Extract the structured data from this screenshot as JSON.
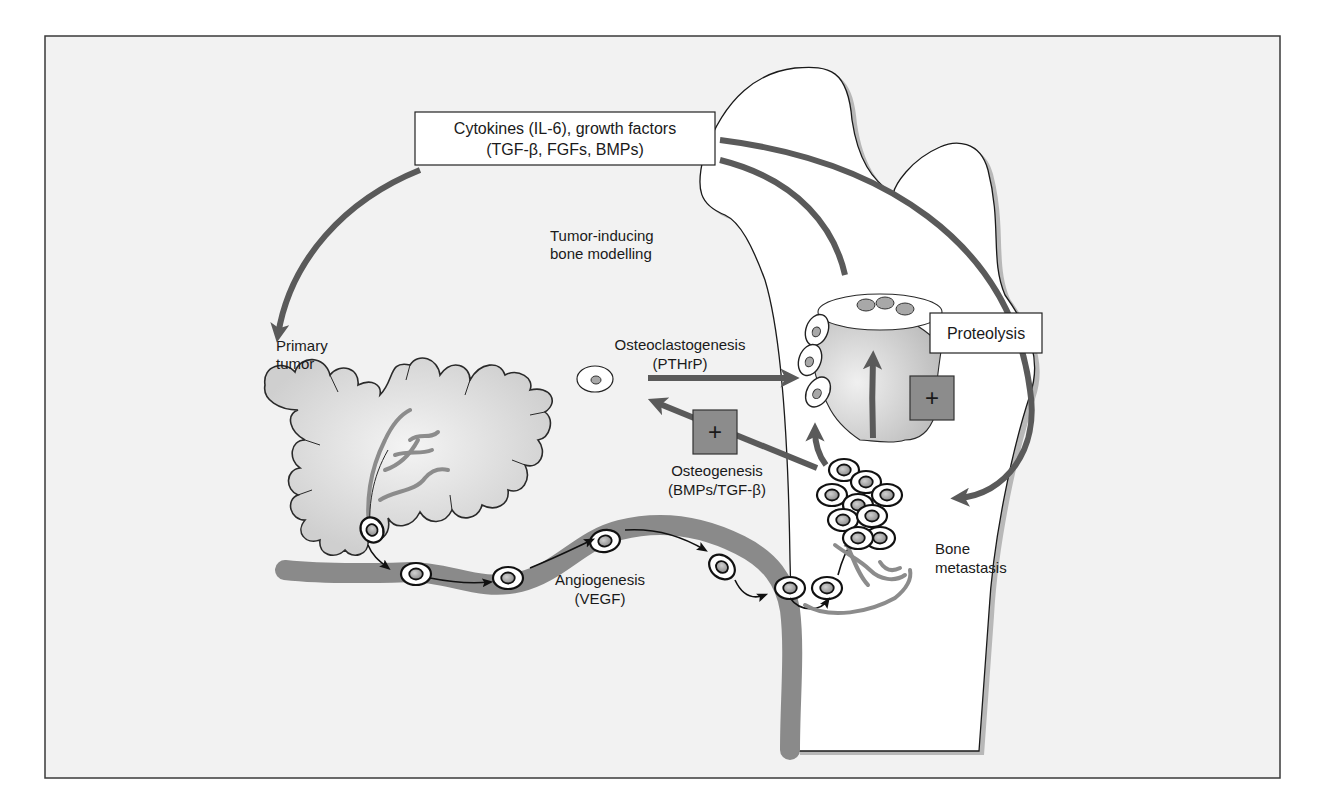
{
  "figure": {
    "type": "schematic",
    "topic": "Bone metastasis pathway",
    "colors": {
      "background": "#f2f2f2",
      "frame": "#3a3a3a",
      "arrow": "#5a5a5a",
      "vessel": "#8a8a8a",
      "tumor_fill": "#d6d6d6",
      "bone_fill": "#ffffff",
      "plus_box": "#8c8c8c",
      "cell_nucleus": "#a8a8a8",
      "resorption_zone": "#c9c9c9"
    }
  },
  "labels": {
    "cytokines_box": {
      "line1": "Cytokines (IL-6), growth factors",
      "line2": "(TGF-β, FGFs, BMPs)"
    },
    "tumor_inducing": {
      "line1": "Tumor-inducing",
      "line2": "bone modelling"
    },
    "primary_tumor": {
      "line1": "Primary",
      "line2": "tumor"
    },
    "osteoclastogenesis": {
      "line1": "Osteoclastogenesis",
      "line2": "(PTHrP)"
    },
    "osteogenesis": {
      "line1": "Osteogenesis",
      "line2": "(BMPs/TGF-β)"
    },
    "angiogenesis": {
      "line1": "Angiogenesis",
      "line2": "(VEGF)"
    },
    "proteolysis_box": "Proteolysis",
    "bone_metastasis": {
      "line1": "Bone",
      "line2": "metastasis"
    },
    "plus_symbol": "+"
  }
}
